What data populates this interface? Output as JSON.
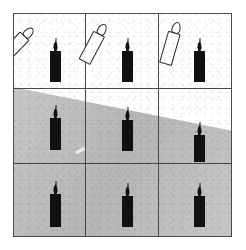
{
  "figure": {
    "title": "",
    "background_color": "#ffffff",
    "panel": {
      "border_color": "#4a4a4a",
      "x": 13,
      "y": 13,
      "width": 219,
      "height": 224,
      "grid": {
        "rows": 3,
        "columns": 3,
        "row_dividers_y": [
          88,
          163
        ],
        "column_dividers_x": [
          85,
          158
        ]
      }
    },
    "ground": {
      "name": "gray-ground-plane",
      "color": "#c2c1bf",
      "horizon_left_y_pct": 33.0,
      "horizon_right_y_pct": 52.5,
      "description": "gray textured floor whose slanted top edge descends from right to left"
    },
    "sky": {
      "name": "white-background",
      "color": "#ffffff"
    },
    "scratch": {
      "name": "white-scratch-mark",
      "color": "#ffffff"
    }
  },
  "cells": [
    {
      "id": "cell-top-left",
      "row": 1,
      "column": 1,
      "background": "white",
      "objects": [
        {
          "type": "candle",
          "style": "outline",
          "color": "#ffffff",
          "tilt_degrees": 44,
          "upright": false
        },
        {
          "type": "candle",
          "style": "solid",
          "color": "#111111",
          "tilt_degrees": 0,
          "upright": true
        }
      ]
    },
    {
      "id": "cell-top-center",
      "row": 1,
      "column": 2,
      "background": "white",
      "objects": [
        {
          "type": "candle",
          "style": "outline",
          "color": "#ffffff",
          "tilt_degrees": 28,
          "upright": false
        },
        {
          "type": "candle",
          "style": "solid",
          "color": "#111111",
          "tilt_degrees": 0,
          "upright": true
        }
      ]
    },
    {
      "id": "cell-top-right",
      "row": 1,
      "column": 3,
      "background": "white",
      "objects": [
        {
          "type": "candle",
          "style": "outline",
          "color": "#ffffff",
          "tilt_degrees": 16,
          "upright": false
        },
        {
          "type": "candle",
          "style": "solid",
          "color": "#111111",
          "tilt_degrees": 0,
          "upright": true
        }
      ]
    },
    {
      "id": "cell-middle-left",
      "row": 2,
      "column": 1,
      "background": "gray",
      "objects": [
        {
          "type": "candle",
          "style": "solid",
          "color": "#111111",
          "tilt_degrees": 0,
          "upright": true
        }
      ]
    },
    {
      "id": "cell-middle-center",
      "row": 2,
      "column": 2,
      "background": "gray",
      "objects": [
        {
          "type": "candle",
          "style": "solid",
          "color": "#111111",
          "tilt_degrees": 0,
          "upright": true
        }
      ]
    },
    {
      "id": "cell-middle-right",
      "row": 2,
      "column": 3,
      "background": "gray",
      "objects": [
        {
          "type": "candle",
          "style": "solid",
          "color": "#111111",
          "tilt_degrees": 0,
          "upright": true
        }
      ]
    },
    {
      "id": "cell-bottom-left",
      "row": 3,
      "column": 1,
      "background": "gray",
      "objects": [
        {
          "type": "candle",
          "style": "solid",
          "color": "#111111",
          "tilt_degrees": 0,
          "upright": true
        }
      ]
    },
    {
      "id": "cell-bottom-center",
      "row": 3,
      "column": 2,
      "background": "gray",
      "objects": [
        {
          "type": "candle",
          "style": "solid",
          "color": "#111111",
          "tilt_degrees": 0,
          "upright": true
        }
      ]
    },
    {
      "id": "cell-bottom-right",
      "row": 3,
      "column": 3,
      "background": "gray",
      "objects": [
        {
          "type": "candle",
          "style": "solid",
          "color": "#111111",
          "tilt_degrees": 0,
          "upright": true
        }
      ]
    }
  ],
  "labels": {
    "caption": "",
    "axis_x": "",
    "axis_y": ""
  }
}
